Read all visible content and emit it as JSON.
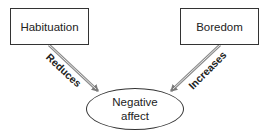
{
  "diagram": {
    "nodes": {
      "habituation": {
        "label": "Habituation",
        "shape": "rectangle"
      },
      "boredom": {
        "label": "Boredom",
        "shape": "rectangle"
      },
      "negative_affect": {
        "label_line1": "Negative",
        "label_line2": "affect",
        "shape": "ellipse"
      }
    },
    "edges": [
      {
        "from": "habituation",
        "to": "negative_affect",
        "label": "Reduces"
      },
      {
        "from": "boredom",
        "to": "negative_affect",
        "label": "Increases"
      }
    ],
    "colors": {
      "arrow": "#8a8a8a",
      "border": "#333333",
      "text": "#222222",
      "background": "#ffffff"
    }
  }
}
